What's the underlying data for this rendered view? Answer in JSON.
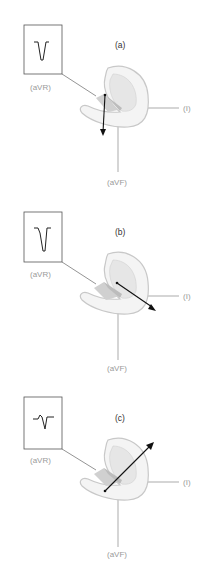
{
  "figure": {
    "panels": [
      {
        "id": "a",
        "title": "(a)",
        "ecg_box_label": "(aVR)",
        "lead_i_label": "(I)",
        "lead_avf_label": "(aVF)",
        "ecg_waveform": "deep-negative-deflection",
        "vector_direction": "downward"
      },
      {
        "id": "b",
        "title": "(b)",
        "ecg_box_label": "(aVR)",
        "lead_i_label": "(I)",
        "lead_avf_label": "(aVF)",
        "ecg_waveform": "negative-deflection-with-small-notch",
        "vector_direction": "down-right"
      },
      {
        "id": "c",
        "title": "(c)",
        "ecg_box_label": "(aVR)",
        "lead_i_label": "(I)",
        "lead_avf_label": "(aVF)",
        "ecg_waveform": "biphasic-small-up-then-down",
        "vector_direction": "up-right"
      }
    ],
    "colors": {
      "label_gray": "#9a9a9a",
      "line_gray": "#888888",
      "heart_outline": "#c8c8c8",
      "heart_fill": "#f4f4f4",
      "heart_inner": "#d6d6d6",
      "vector": "#111111"
    }
  }
}
